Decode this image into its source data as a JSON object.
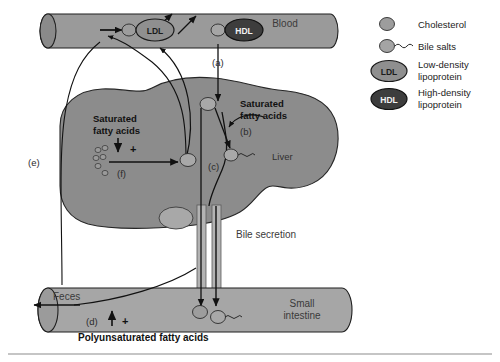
{
  "figure": {
    "background_color": "#ffffff",
    "organ_fill": "#8c8c8c",
    "vessel_fill": "#9a9a9a",
    "intestine_fill": "#a6a6a6",
    "hdl_fill": "#3d3d3d",
    "ldl_fill": "#8f8f8f",
    "particle_fill": "#9d9d9d",
    "line_color": "#1a1a1a"
  },
  "organs": {
    "blood": "Blood",
    "liver": "Liver",
    "small_intestine_line1": "Small",
    "small_intestine_line2": "intestine",
    "feces": "Feces",
    "bile_secretion": "Bile secretion"
  },
  "annotations": {
    "a": "(a)",
    "b": "(b)",
    "c": "(c)",
    "d": "(d)",
    "e": "(e)",
    "f": "(f)"
  },
  "texts": {
    "saturated_left_line1": "Saturated",
    "saturated_left_line2": "fatty acids",
    "saturated_right_line1": "Saturated",
    "saturated_right_line2": "fatty acids",
    "polyunsaturated": "Polyunsaturated fatty acids",
    "plus_left": "+",
    "plus_bottom": "+"
  },
  "lipoproteins": {
    "ldl": "LDL",
    "hdl": "HDL"
  },
  "legend": {
    "items": [
      {
        "icon": "cholesterol-blob-icon",
        "label": "Cholesterol",
        "label2": ""
      },
      {
        "icon": "bile-salt-icon",
        "label": "Bile salts",
        "label2": ""
      },
      {
        "icon": "ldl-ellipse-icon",
        "label": "Low-density",
        "label2": "lipoprotein"
      },
      {
        "icon": "hdl-ellipse-icon",
        "label": "High-density",
        "label2": "lipoprotein"
      }
    ]
  }
}
